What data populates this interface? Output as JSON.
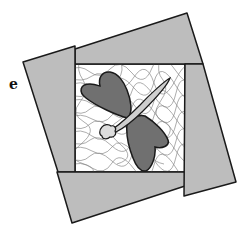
{
  "figure": {
    "panel_label": "e",
    "colors": {
      "frame": "#bdbdbd",
      "frame_stroke": "#1a1a1a",
      "center_bg": "#ffffff",
      "contour_lines": "#8a8a8a",
      "wings": "#707070",
      "body": "#cfcfcf"
    }
  }
}
